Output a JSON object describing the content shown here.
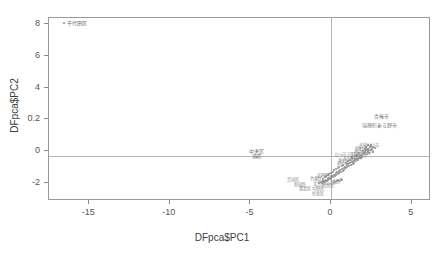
{
  "chart_data": {
    "type": "scatter",
    "title": "",
    "xlabel": "DFpca$PC1",
    "ylabel": "DFpca$PC2",
    "xlim": [
      -17.5,
      6.2
    ],
    "ylim": [
      -2.9,
      8.9
    ],
    "xticks": [
      -15,
      -10,
      -5,
      0,
      5
    ],
    "xticklabels": [
      "-15",
      "-10",
      "-5",
      "0",
      "5"
    ],
    "yticks": [
      8,
      6,
      4,
      0.2,
      0,
      -2
    ],
    "yticklabels": [
      "8",
      "6",
      "4",
      "0.2",
      "0",
      "-2"
    ],
    "grid": false,
    "legend": false,
    "reference_lines": {
      "hline": 0,
      "vline": 0
    },
    "point_color": "#8e8e8e",
    "label_color": "#8a8a8a",
    "frame_color": "#9a9a9a",
    "outliers": [
      {
        "label": "千代田区",
        "x": -16.6,
        "y": 8.6
      },
      {
        "label": "中央区",
        "x": -4.6,
        "y": 0.35
      },
      {
        "label": "港区",
        "x": -4.6,
        "y": -0.02
      },
      {
        "label": "青梅市",
        "x": 3.15,
        "y": 2.55
      },
      {
        "label": "瑞穂町ある野市",
        "x": 3.0,
        "y": 2.0
      }
    ],
    "lower_labels": [
      {
        "label": "渋谷区",
        "x": -2.35,
        "y": -1.55
      },
      {
        "label": "新宿区",
        "x": -1.95,
        "y": -1.85
      },
      {
        "label": "豊島区",
        "x": -1.6,
        "y": -2.15
      },
      {
        "label": "台東区",
        "x": -0.95,
        "y": -1.5
      },
      {
        "label": "文京区",
        "x": -0.72,
        "y": -1.78
      },
      {
        "label": "中野区",
        "x": -0.78,
        "y": -2.12
      },
      {
        "label": "杉並区",
        "x": -0.78,
        "y": -2.42
      },
      {
        "label": "武蔵野市",
        "x": -0.35,
        "y": -1.3
      },
      {
        "label": "荒川区",
        "x": -0.12,
        "y": -1.72
      },
      {
        "label": "北区",
        "x": 0.28,
        "y": -1.68
      },
      {
        "label": "目黒区",
        "x": -0.2,
        "y": -1.95
      }
    ],
    "cluster_labels": [
      {
        "label": "武蔵村山市",
        "x": 2.35,
        "y": 0.62
      },
      {
        "label": "羽村市",
        "x": 1.85,
        "y": 0.45
      },
      {
        "label": "あきる野市",
        "x": 2.05,
        "y": 0.35
      },
      {
        "label": "八王子市",
        "x": 2.0,
        "y": 0.2
      },
      {
        "label": "福生市",
        "x": 1.85,
        "y": 0.02
      },
      {
        "label": "立川市",
        "x": 0.55,
        "y": 0.08
      },
      {
        "label": "日野市",
        "x": 1.35,
        "y": 0.05
      },
      {
        "label": "多摩市",
        "x": 1.55,
        "y": -0.1
      },
      {
        "label": "町田市",
        "x": 1.2,
        "y": -0.2
      },
      {
        "label": "東村山市",
        "x": 0.95,
        "y": -0.35
      },
      {
        "label": "府中市",
        "x": 0.72,
        "y": -0.5
      }
    ],
    "points": [
      {
        "x": -16.6,
        "y": 8.6
      },
      {
        "x": -4.6,
        "y": 0.33
      },
      {
        "x": -4.6,
        "y": -0.05
      },
      {
        "x": 3.15,
        "y": 2.5
      },
      {
        "x": 3.0,
        "y": 1.95
      },
      {
        "x": 2.5,
        "y": 0.72
      },
      {
        "x": 2.62,
        "y": 0.6
      },
      {
        "x": 2.4,
        "y": 0.55
      },
      {
        "x": 2.3,
        "y": 0.48
      },
      {
        "x": 2.18,
        "y": 0.42
      },
      {
        "x": 2.45,
        "y": 0.38
      },
      {
        "x": 2.28,
        "y": 0.3
      },
      {
        "x": 2.1,
        "y": 0.28
      },
      {
        "x": 2.0,
        "y": 0.22
      },
      {
        "x": 2.2,
        "y": 0.15
      },
      {
        "x": 2.05,
        "y": 0.1
      },
      {
        "x": 1.92,
        "y": 0.05
      },
      {
        "x": 1.8,
        "y": 0.0
      },
      {
        "x": 1.95,
        "y": -0.05
      },
      {
        "x": 1.72,
        "y": -0.1
      },
      {
        "x": 1.85,
        "y": -0.15
      },
      {
        "x": 1.62,
        "y": -0.18
      },
      {
        "x": 1.5,
        "y": -0.22
      },
      {
        "x": 1.68,
        "y": -0.28
      },
      {
        "x": 1.42,
        "y": -0.3
      },
      {
        "x": 1.55,
        "y": -0.35
      },
      {
        "x": 1.3,
        "y": -0.38
      },
      {
        "x": 1.45,
        "y": -0.42
      },
      {
        "x": 1.2,
        "y": -0.45
      },
      {
        "x": 1.35,
        "y": -0.5
      },
      {
        "x": 1.08,
        "y": -0.52
      },
      {
        "x": 1.22,
        "y": -0.58
      },
      {
        "x": 0.98,
        "y": -0.6
      },
      {
        "x": 1.12,
        "y": -0.65
      },
      {
        "x": 0.88,
        "y": -0.68
      },
      {
        "x": 1.0,
        "y": -0.72
      },
      {
        "x": 0.78,
        "y": -0.75
      },
      {
        "x": 0.92,
        "y": -0.8
      },
      {
        "x": 0.68,
        "y": -0.82
      },
      {
        "x": 0.82,
        "y": -0.88
      },
      {
        "x": 0.58,
        "y": -0.9
      },
      {
        "x": 0.72,
        "y": -0.95
      },
      {
        "x": 0.48,
        "y": -0.98
      },
      {
        "x": 0.62,
        "y": -1.02
      },
      {
        "x": 0.38,
        "y": -1.05
      },
      {
        "x": 0.52,
        "y": -1.1
      },
      {
        "x": 0.28,
        "y": -1.12
      },
      {
        "x": 0.42,
        "y": -1.18
      },
      {
        "x": 0.18,
        "y": -1.2
      },
      {
        "x": 0.32,
        "y": -1.25
      },
      {
        "x": 0.08,
        "y": -1.28
      },
      {
        "x": 0.22,
        "y": -1.32
      },
      {
        "x": -0.02,
        "y": -1.35
      },
      {
        "x": 0.12,
        "y": -1.38
      },
      {
        "x": -0.12,
        "y": -1.42
      },
      {
        "x": 0.02,
        "y": -1.45
      },
      {
        "x": -0.22,
        "y": -1.48
      },
      {
        "x": -0.08,
        "y": -1.5
      },
      {
        "x": -0.32,
        "y": -1.52
      },
      {
        "x": -0.18,
        "y": -1.55
      },
      {
        "x": -0.42,
        "y": -1.58
      },
      {
        "x": -0.28,
        "y": -1.6
      },
      {
        "x": -0.52,
        "y": -1.62
      },
      {
        "x": -0.38,
        "y": -1.65
      },
      {
        "x": -0.62,
        "y": -1.68
      },
      {
        "x": -0.48,
        "y": -1.7
      },
      {
        "x": -0.72,
        "y": -1.72
      },
      {
        "x": -0.58,
        "y": -1.75
      },
      {
        "x": 0.45,
        "y": -1.52
      },
      {
        "x": 0.6,
        "y": -1.48
      },
      {
        "x": 0.35,
        "y": -1.58
      },
      {
        "x": 0.55,
        "y": -1.62
      },
      {
        "x": 0.25,
        "y": -1.65
      },
      {
        "x": 0.68,
        "y": -1.55
      },
      {
        "x": 2.38,
        "y": 0.2
      },
      {
        "x": 2.55,
        "y": 0.45
      },
      {
        "x": 2.15,
        "y": 0.58
      },
      {
        "x": 1.98,
        "y": 0.35
      },
      {
        "x": 1.75,
        "y": 0.18
      },
      {
        "x": 1.6,
        "y": 0.08
      },
      {
        "x": 1.48,
        "y": -0.02
      },
      {
        "x": 1.28,
        "y": -0.12
      },
      {
        "x": 1.15,
        "y": -0.25
      },
      {
        "x": 1.02,
        "y": -0.32
      },
      {
        "x": 0.9,
        "y": -0.42
      },
      {
        "x": 0.75,
        "y": -0.55
      },
      {
        "x": 0.65,
        "y": -0.62
      },
      {
        "x": 0.5,
        "y": -0.7
      },
      {
        "x": 0.4,
        "y": -0.78
      },
      {
        "x": 0.3,
        "y": -0.85
      },
      {
        "x": 0.2,
        "y": -0.92
      },
      {
        "x": 0.1,
        "y": -1.0
      },
      {
        "x": 0.0,
        "y": -1.08
      },
      {
        "x": -0.1,
        "y": -1.15
      },
      {
        "x": -0.2,
        "y": -1.22
      },
      {
        "x": -0.3,
        "y": -1.3
      },
      {
        "x": -0.4,
        "y": -1.38
      },
      {
        "x": -0.5,
        "y": -1.45
      },
      {
        "x": 2.7,
        "y": 0.5
      },
      {
        "x": 2.62,
        "y": 0.28
      },
      {
        "x": 2.45,
        "y": 0.62
      },
      {
        "x": 2.28,
        "y": 0.68
      },
      {
        "x": 2.08,
        "y": 0.48
      }
    ]
  }
}
